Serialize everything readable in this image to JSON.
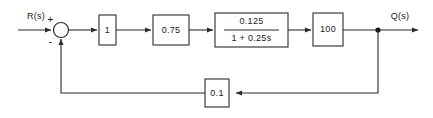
{
  "diagram": {
    "input_label": "R(s)",
    "output_label": "Q(s)",
    "summing_junction": {
      "positive_sign": "+",
      "negative_sign": "-"
    },
    "forward_blocks": [
      {
        "id": "gain-unity",
        "label": "1"
      },
      {
        "id": "gain-075",
        "label": "0.75"
      },
      {
        "id": "lag-transfer-function",
        "numerator": "0.125",
        "denominator": "1 + 0.25s"
      },
      {
        "id": "gain-100",
        "label": "100"
      }
    ],
    "feedback_block": {
      "id": "feedback-gain",
      "label": "0.1"
    }
  },
  "colors": {
    "line": "#2b2b2b",
    "text": "#1a1a1a",
    "background": "#ffffff"
  }
}
